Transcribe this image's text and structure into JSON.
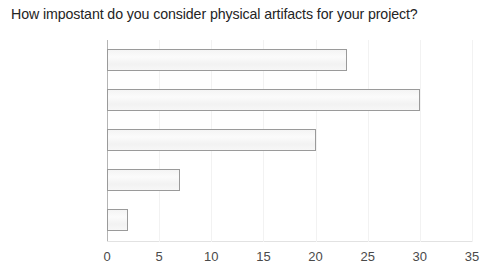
{
  "chart_data": {
    "type": "bar",
    "orientation": "horizontal",
    "title": "How impostant do you consider physical artifacts for your project?",
    "xlabel": "",
    "ylabel": "",
    "categories": [
      "Very Important",
      "Important",
      "Neutral",
      "Unimportant",
      "Very Unimportant"
    ],
    "values": [
      23,
      30,
      20,
      7,
      2
    ],
    "xlim": [
      0,
      35
    ],
    "xticks": [
      0,
      5,
      10,
      15,
      20,
      25,
      30,
      35
    ],
    "xtick_labels": [
      "0",
      "5",
      "10",
      "15",
      "20",
      "25",
      "30",
      "35"
    ],
    "grid": false,
    "legend": null,
    "bar_fill_color": "#f6f6f6",
    "bar_border_color": "#9a9a9a",
    "text_color": "#242424"
  }
}
